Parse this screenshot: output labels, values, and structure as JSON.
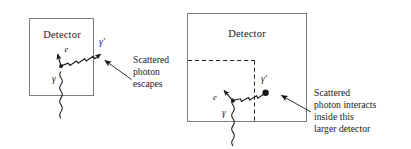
{
  "figure": {
    "background_color": "#ffffff",
    "stroke_color": "#1a1a1a",
    "box_stroke_color": "#777777",
    "panels": [
      {
        "id": "left-panel",
        "name": "small-detector-panel",
        "detector_label": "Detector",
        "incoming_photon_label": "γ",
        "electron_label": "e",
        "scattered_photon_label": "γ′",
        "annotation_lines": [
          "Scattered",
          "photon",
          "escapes"
        ],
        "outcome": "escapes"
      },
      {
        "id": "right-panel",
        "name": "large-detector-panel",
        "detector_label": "Detector",
        "incoming_photon_label": "γ",
        "electron_label": "e",
        "scattered_photon_label": "γ′",
        "annotation_lines": [
          "Scattered",
          "photon interacts",
          "inside this",
          "larger detector"
        ],
        "outcome": "interacts inside larger detector"
      }
    ]
  }
}
